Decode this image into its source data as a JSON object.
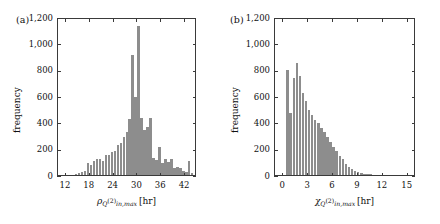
{
  "figure": {
    "background": "#ffffff",
    "bar_color": "#8d8d8d",
    "axis_color": "#3a3a3a"
  },
  "panels": [
    {
      "id": "a",
      "label": "(a)",
      "ylabel": "frequency",
      "xlabel_plain": "rho_{Q^{(2)}_{in,max}} [hr]",
      "xlabel_parts": {
        "symbol": "ρ",
        "sub_main": "Q",
        "sub_sup": "(2)",
        "sub_sub": "in,max",
        "unit": "[hr]"
      }
    },
    {
      "id": "b",
      "label": "(b)",
      "ylabel": "frequency",
      "xlabel_plain": "chi_{Q^{(2)}_{in,max}} [hr]",
      "xlabel_parts": {
        "symbol": "χ",
        "sub_main": "Q",
        "sub_sup": "(2)",
        "sub_sub": "in,max",
        "unit": "[hr]"
      }
    }
  ],
  "chart_data": [
    {
      "type": "bar",
      "panel": "a",
      "title": "",
      "xlabel": "ρ Q(2) in,max [hr]",
      "ylabel": "frequency",
      "xlim": [
        10,
        45
      ],
      "ylim": [
        0,
        1200
      ],
      "xticks": [
        12,
        18,
        24,
        30,
        36,
        42
      ],
      "xticklabels": [
        "12",
        "18",
        "24",
        "30",
        "36",
        "42"
      ],
      "yticks": [
        0,
        200,
        400,
        600,
        800,
        1000,
        1200
      ],
      "yticklabels": [
        "0",
        "200",
        "400",
        "600",
        "800",
        "1,000",
        "1,200"
      ],
      "grid": false,
      "legend": false,
      "bin_width": 0.75,
      "bin_left_edges": [
        14.25,
        15.0,
        15.75,
        16.5,
        17.25,
        18.0,
        18.75,
        19.5,
        20.25,
        21.0,
        21.75,
        22.5,
        23.25,
        24.0,
        24.75,
        25.5,
        26.25,
        27.0,
        27.75,
        28.5,
        29.25,
        30.0,
        30.75,
        31.5,
        32.25,
        33.0,
        33.75,
        34.5,
        35.25,
        36.0,
        36.75,
        37.5,
        38.25,
        39.0,
        39.75,
        40.5,
        41.25,
        42.0,
        42.75,
        43.5
      ],
      "values": [
        10,
        18,
        20,
        30,
        95,
        75,
        110,
        120,
        125,
        105,
        155,
        150,
        175,
        185,
        230,
        245,
        285,
        330,
        425,
        915,
        590,
        1130,
        430,
        340,
        365,
        435,
        130,
        115,
        210,
        95,
        125,
        100,
        120,
        55,
        60,
        50,
        30,
        20,
        110,
        15
      ]
    },
    {
      "type": "bar",
      "panel": "b",
      "title": "",
      "xlabel": "χ Q(2) in,max [hr]",
      "ylabel": "frequency",
      "xlim": [
        -1,
        16
      ],
      "ylim": [
        0,
        1200
      ],
      "xticks": [
        0,
        3,
        6,
        9,
        12,
        15
      ],
      "xticklabels": [
        "0",
        "3",
        "6",
        "9",
        "12",
        "15"
      ],
      "yticks": [
        0,
        200,
        400,
        600,
        800,
        1000,
        1200
      ],
      "yticklabels": [
        "0",
        "200",
        "400",
        "600",
        "800",
        "1,000",
        "1,200"
      ],
      "grid": false,
      "legend": false,
      "bin_width": 0.37,
      "bin_left_edges": [
        0.37,
        0.74,
        1.11,
        1.48,
        1.85,
        2.22,
        2.59,
        2.96,
        3.33,
        3.7,
        4.07,
        4.44,
        4.81,
        5.18,
        5.55,
        5.92,
        6.29,
        6.66,
        7.03,
        7.4,
        7.77,
        8.14,
        8.51,
        8.88,
        9.25,
        9.62,
        9.99,
        10.36
      ],
      "values": [
        800,
        470,
        740,
        850,
        750,
        620,
        560,
        490,
        455,
        420,
        395,
        355,
        330,
        290,
        250,
        215,
        185,
        145,
        120,
        80,
        60,
        45,
        32,
        22,
        14,
        9,
        6,
        4
      ]
    }
  ]
}
